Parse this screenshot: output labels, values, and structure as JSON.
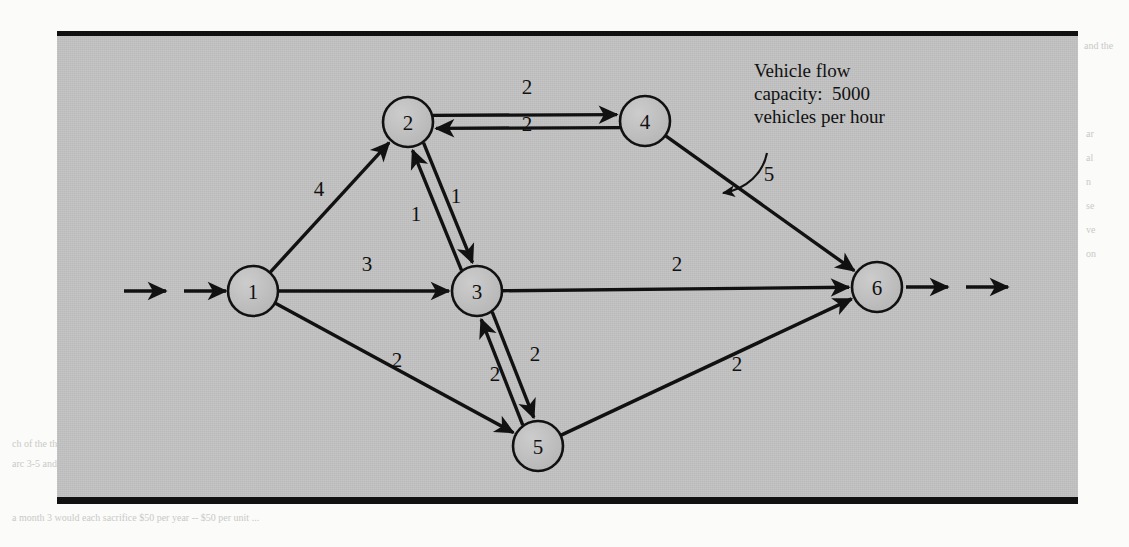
{
  "figure": {
    "panel_color": "#c2c2c2",
    "node_fill": "#bdbdbd",
    "stroke_color": "#111111",
    "annotation": "Vehicle flow\ncapacity:  5000\nvehicles per hour"
  },
  "chart_data": {
    "type": "diagram",
    "title": "",
    "subtype": "directed-network-flow",
    "nodes": [
      {
        "id": "1",
        "label": "1",
        "x": 196,
        "y": 260,
        "r": 25,
        "role": "source"
      },
      {
        "id": "2",
        "label": "2",
        "x": 351,
        "y": 91,
        "r": 25,
        "role": "transshipment"
      },
      {
        "id": "3",
        "label": "3",
        "x": 420,
        "y": 260,
        "r": 25,
        "role": "transshipment"
      },
      {
        "id": "4",
        "label": "4",
        "x": 588,
        "y": 90,
        "r": 25,
        "role": "transshipment"
      },
      {
        "id": "5",
        "label": "5",
        "x": 481,
        "y": 415,
        "r": 25,
        "role": "transshipment"
      },
      {
        "id": "6",
        "label": "6",
        "x": 820,
        "y": 256,
        "r": 25,
        "role": "sink"
      }
    ],
    "edges": [
      {
        "from": "1",
        "to": "2",
        "label": "4",
        "lx": 262,
        "ly": 165
      },
      {
        "from": "1",
        "to": "3",
        "label": "3",
        "lx": 310,
        "ly": 240
      },
      {
        "from": "1",
        "to": "5",
        "label": "2",
        "lx": 340,
        "ly": 336
      },
      {
        "from": "2",
        "to": "4",
        "label": "2",
        "lx": 470,
        "ly": 100
      },
      {
        "from": "4",
        "to": "2",
        "label": "2",
        "lx": 470,
        "ly": 63
      },
      {
        "from": "2",
        "to": "3",
        "label": "1",
        "lx": 399,
        "ly": 172
      },
      {
        "from": "3",
        "to": "2",
        "label": "1",
        "lx": 359,
        "ly": 190
      },
      {
        "from": "3",
        "to": "5",
        "label": "2",
        "lx": 478,
        "ly": 330
      },
      {
        "from": "5",
        "to": "3",
        "label": "2",
        "lx": 438,
        "ly": 350
      },
      {
        "from": "3",
        "to": "6",
        "label": "2",
        "lx": 620,
        "ly": 240
      },
      {
        "from": "4",
        "to": "6",
        "label": "5",
        "lx": 712,
        "ly": 150
      },
      {
        "from": "5",
        "to": "6",
        "label": "2",
        "lx": 680,
        "ly": 340
      }
    ],
    "source_arrows": 2,
    "sink_arrows": 2,
    "annotation": "Vehicle flow capacity:  5000 vehicles per hour",
    "annotation_target_edge": "4-6",
    "units": "thousands of vehicles per hour"
  },
  "ghost_text": {
    "right_col": [
      "and the",
      "",
      "ar",
      "al",
      "n",
      "se",
      "ve",
      "on"
    ],
    "bottom_line_1": "ch of the three arcs. A unit of flow from node 3 to node 5 would reduce",
    "bottom_line_2": "arc 3-5 and increase the flow on arc 5-3.",
    "bottom_line_3": "a month 3 would each sacrifice $50 per year -- $50 per unit ..."
  }
}
